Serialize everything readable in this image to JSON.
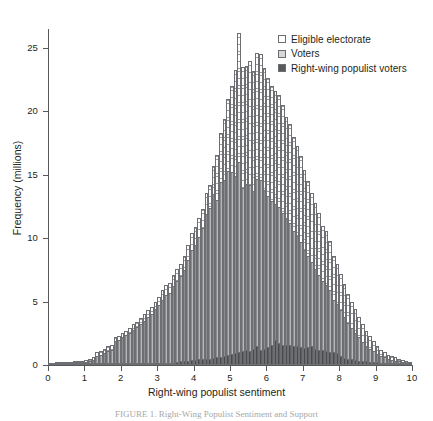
{
  "figure": {
    "caption": "FIGURE 1.  Right-Wing Populist Sentiment and Support"
  },
  "legend": {
    "position": "top-right",
    "items": [
      {
        "label": "Eligible electorate",
        "swatch": "hatched-white-square-icon",
        "color": "#ffffff"
      },
      {
        "label": "Voters",
        "swatch": "light-grey-square-icon",
        "color": "#d6d7d9"
      },
      {
        "label": "Right-wing populist voters",
        "swatch": "dark-grey-square-icon",
        "color": "#58595b"
      }
    ]
  },
  "chart_data": {
    "type": "bar",
    "title": "",
    "subtitle": "",
    "xlabel": "Right-wing populist sentiment",
    "ylabel": "Frequency (millions)",
    "xlim": [
      0,
      10
    ],
    "ylim": [
      0,
      26.5
    ],
    "xticks": [
      0,
      1,
      2,
      3,
      4,
      5,
      6,
      7,
      8,
      9,
      10
    ],
    "xtick_labels": [
      "0",
      "1",
      "2",
      "3",
      "4",
      "5",
      "6",
      "7",
      "8",
      "9",
      "10"
    ],
    "yticks": [
      0,
      5,
      10,
      15,
      20,
      25
    ],
    "ytick_labels": [
      "0",
      "5",
      "10",
      "15",
      "20",
      "25"
    ],
    "grid": false,
    "stacking": "overlaid",
    "bin_width": 0.1,
    "x": [
      0.05,
      0.15,
      0.25,
      0.35,
      0.45,
      0.55,
      0.65,
      0.75,
      0.85,
      0.95,
      1.05,
      1.15,
      1.25,
      1.35,
      1.45,
      1.55,
      1.65,
      1.75,
      1.85,
      1.95,
      2.05,
      2.15,
      2.25,
      2.35,
      2.45,
      2.55,
      2.65,
      2.75,
      2.85,
      2.95,
      3.05,
      3.15,
      3.25,
      3.35,
      3.45,
      3.55,
      3.65,
      3.75,
      3.85,
      3.95,
      4.05,
      4.15,
      4.25,
      4.35,
      4.45,
      4.55,
      4.65,
      4.75,
      4.85,
      4.95,
      5.05,
      5.15,
      5.25,
      5.35,
      5.45,
      5.55,
      5.65,
      5.75,
      5.85,
      5.95,
      6.05,
      6.15,
      6.25,
      6.35,
      6.45,
      6.55,
      6.65,
      6.75,
      6.85,
      6.95,
      7.05,
      7.15,
      7.25,
      7.35,
      7.45,
      7.55,
      7.65,
      7.75,
      7.85,
      7.95,
      8.05,
      8.15,
      8.25,
      8.35,
      8.45,
      8.55,
      8.65,
      8.75,
      8.85,
      8.95,
      9.05,
      9.15,
      9.25,
      9.35,
      9.45,
      9.55,
      9.65,
      9.75,
      9.85,
      9.95
    ],
    "series": [
      {
        "name": "Eligible electorate",
        "color": "#ffffff",
        "pattern": "cross-hatch",
        "peak_value": 26.2,
        "peak_x": 4.9,
        "values": [
          0.15,
          0.15,
          0.2,
          0.2,
          0.2,
          0.25,
          0.25,
          0.3,
          0.3,
          0.35,
          0.4,
          0.45,
          0.6,
          1.0,
          1.1,
          1.3,
          1.5,
          1.6,
          2.2,
          2.3,
          2.5,
          2.7,
          2.9,
          3.2,
          3.4,
          3.7,
          4.0,
          4.3,
          4.6,
          5.0,
          5.4,
          5.9,
          6.3,
          6.5,
          7.1,
          7.6,
          8.0,
          8.6,
          9.5,
          10.4,
          10.9,
          11.6,
          12.3,
          13.6,
          14.2,
          15.7,
          16.6,
          18.3,
          19.4,
          21.0,
          22.0,
          23.3,
          26.2,
          23.5,
          23.6,
          24.0,
          23.2,
          24.6,
          24.5,
          23.4,
          22.6,
          22.0,
          21.6,
          21.3,
          20.5,
          19.6,
          19.0,
          18.0,
          17.3,
          16.5,
          15.4,
          14.5,
          13.6,
          12.8,
          12.0,
          11.0,
          10.6,
          9.8,
          8.6,
          8.0,
          7.2,
          6.4,
          5.6,
          5.0,
          4.4,
          3.8,
          3.2,
          2.7,
          2.3,
          1.9,
          1.5,
          1.2,
          1.0,
          0.8,
          0.7,
          0.6,
          0.5,
          0.4,
          0.3,
          0.2
        ]
      },
      {
        "name": "Voters",
        "color": "#a7a9ac",
        "pattern": "vertical-stripes",
        "peak_value": 16.0,
        "peak_x": 4.75,
        "values": [
          0.1,
          0.1,
          0.12,
          0.12,
          0.14,
          0.16,
          0.16,
          0.2,
          0.2,
          0.22,
          0.25,
          0.3,
          0.4,
          0.7,
          0.8,
          0.95,
          1.1,
          1.2,
          1.9,
          2.0,
          2.2,
          2.4,
          2.5,
          2.8,
          3.0,
          3.2,
          3.5,
          3.8,
          4.0,
          4.4,
          4.7,
          5.1,
          5.5,
          5.7,
          6.2,
          6.6,
          7.0,
          7.5,
          8.3,
          9.1,
          9.5,
          10.1,
          10.8,
          11.9,
          12.4,
          13.5,
          13.0,
          14.4,
          14.6,
          15.3,
          15.2,
          14.9,
          16.0,
          14.0,
          14.3,
          14.2,
          13.7,
          14.7,
          14.6,
          13.8,
          13.3,
          12.9,
          12.7,
          12.5,
          12.0,
          11.6,
          11.2,
          10.6,
          10.2,
          9.7,
          9.1,
          8.6,
          8.1,
          7.6,
          7.1,
          6.6,
          6.3,
          5.9,
          5.1,
          4.8,
          4.3,
          3.8,
          3.3,
          2.9,
          2.5,
          2.2,
          1.8,
          1.5,
          1.3,
          1.1,
          0.9,
          0.7,
          0.6,
          0.5,
          0.4,
          0.35,
          0.3,
          0.25,
          0.18,
          0.12
        ]
      },
      {
        "name": "Right-wing populist voters",
        "color": "#58595b",
        "pattern": "solid-dark",
        "peak_value": 2.0,
        "peak_x": 6.25,
        "values": [
          0.05,
          0.05,
          0.05,
          0.05,
          0.05,
          0.05,
          0.05,
          0.05,
          0.05,
          0.05,
          0.05,
          0.05,
          0.05,
          0.06,
          0.06,
          0.06,
          0.06,
          0.06,
          0.07,
          0.07,
          0.07,
          0.07,
          0.07,
          0.08,
          0.08,
          0.08,
          0.08,
          0.09,
          0.09,
          0.09,
          0.1,
          0.1,
          0.1,
          0.1,
          0.12,
          0.25,
          0.3,
          0.32,
          0.35,
          0.38,
          0.4,
          0.45,
          0.5,
          0.45,
          0.5,
          0.55,
          0.6,
          0.65,
          0.7,
          0.8,
          0.85,
          0.95,
          1.0,
          1.1,
          1.2,
          1.1,
          1.25,
          1.5,
          1.2,
          1.3,
          1.4,
          1.55,
          2.0,
          1.7,
          1.6,
          1.6,
          1.55,
          1.5,
          1.5,
          1.45,
          1.35,
          1.45,
          1.5,
          1.3,
          1.2,
          1.15,
          1.1,
          1.05,
          1.0,
          0.95,
          0.7,
          0.55,
          0.5,
          0.45,
          0.4,
          0.35,
          0.3,
          0.28,
          0.25,
          0.22,
          0.2,
          0.18,
          0.15,
          0.13,
          0.12,
          0.1,
          0.09,
          0.08,
          0.06,
          0.05
        ]
      }
    ]
  }
}
